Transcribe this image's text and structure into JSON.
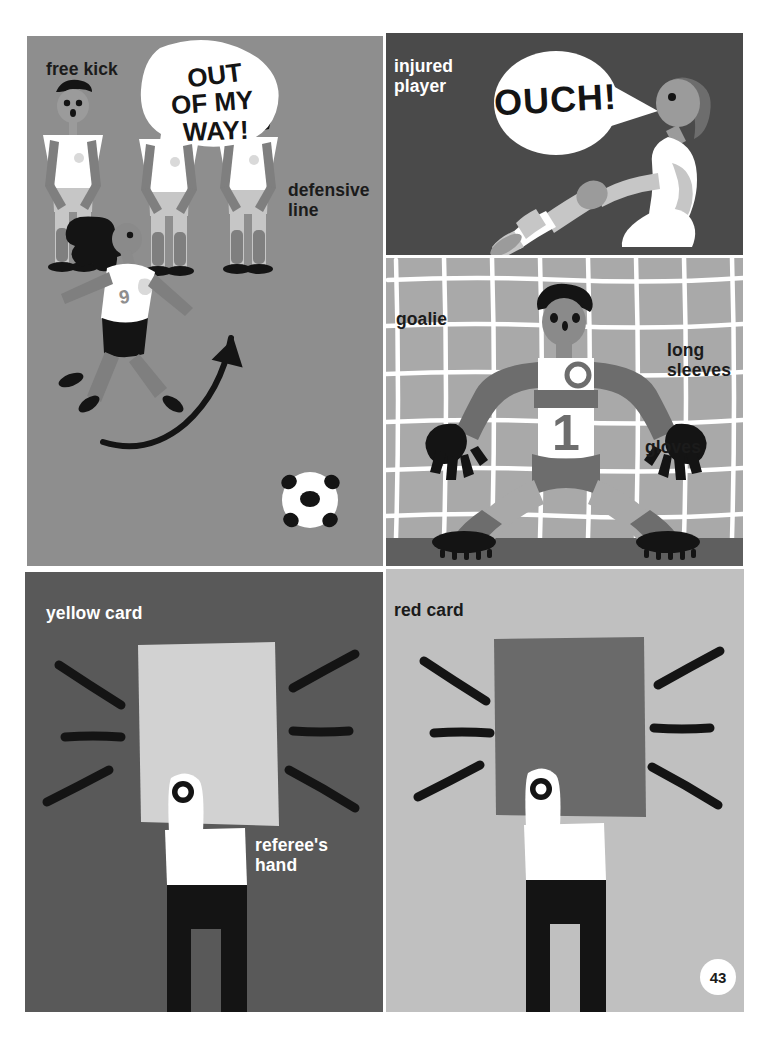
{
  "page": {
    "number": "43",
    "width": 774,
    "height": 1037,
    "background": "#ffffff"
  },
  "panels": [
    {
      "id": "free-kick",
      "background": "#8e8e8e",
      "labels": [
        "free kick",
        "defensive\nline"
      ],
      "speech": "OUT\nOF MY\nWAY!",
      "jersey_number": "9"
    },
    {
      "id": "injured-player",
      "background": "#4a4a4a",
      "labels": [
        "injured\nplayer"
      ],
      "speech": "OUCH!"
    },
    {
      "id": "goalie",
      "background": "#a9a9a9",
      "labels": [
        "goalie",
        "long\nsleeves",
        "gloves"
      ],
      "jersey_number": "1"
    },
    {
      "id": "yellow-card",
      "background": "#595959",
      "card_color": "#d2d2d2",
      "labels": [
        "yellow card",
        "referee's\nhand"
      ]
    },
    {
      "id": "red-card",
      "background": "#c0c0c0",
      "card_color": "#6a6a6a",
      "labels": [
        "red card"
      ]
    }
  ],
  "text": {
    "free_kick": "free kick",
    "defensive_line": "defensive\nline",
    "injured_player": "injured\nplayer",
    "goalie": "goalie",
    "long_sleeves": "long\nsleeves",
    "gloves": "gloves",
    "yellow_card": "yellow card",
    "red_card": "red card",
    "referees_hand": "referee's\nhand",
    "speech_ouch": "OUCH!",
    "speech_out_of_my_way_1": "OUT",
    "speech_out_of_my_way_2": "OF MY",
    "speech_out_of_my_way_3": "WAY!",
    "goalie_number": "1",
    "striker_number": "9",
    "page_number": "43"
  },
  "colors": {
    "panel_free_kick": "#8e8e8e",
    "panel_injured": "#4a4a4a",
    "panel_goalie": "#a9a9a9",
    "panel_yellow_card": "#595959",
    "panel_red_card": "#c0c0c0",
    "yellow_card": "#d2d2d2",
    "red_card": "#6a6a6a",
    "skin_light": "#9b9b9b",
    "skin_dark": "#8a8a8a",
    "jersey_white": "#ffffff",
    "shorts_light": "#c6c6c6",
    "limb_gray": "#7f7f7f",
    "boot_black": "#141414",
    "ink_black": "#1b1b1b",
    "net_white": "#ffffff",
    "goalie_dark": "#6d6d6d",
    "ground_dark": "#5f5f5f"
  }
}
